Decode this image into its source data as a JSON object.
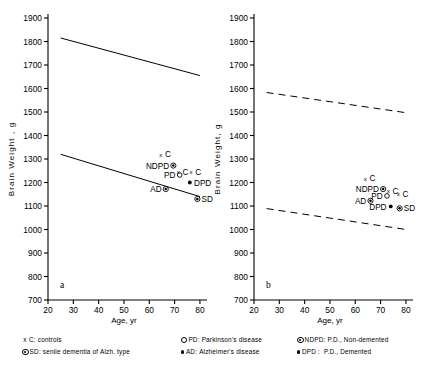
{
  "figure": {
    "panels": [
      {
        "id": "a",
        "label": "a",
        "xlabel": "Age, yr",
        "ylabel": "Brain  Weight , g",
        "xticks": [
          20,
          30,
          40,
          50,
          60,
          70,
          80
        ],
        "yticks": [
          700,
          800,
          900,
          1000,
          1100,
          1200,
          1300,
          1400,
          1500,
          1600,
          1700,
          1800,
          1900
        ],
        "xlim": [
          20,
          82
        ],
        "ylim": [
          700,
          1900
        ],
        "linestyle": "solid",
        "lines": [
          {
            "name": "upper-regression-line",
            "x": [
              25,
              80
            ],
            "y": [
              1815,
              1655
            ]
          },
          {
            "name": "lower-regression-line",
            "x": [
              25,
              80
            ],
            "y": [
              1320,
              1140
            ]
          }
        ],
        "points": [
          {
            "label": "C",
            "marker": "x",
            "x": 64.5,
            "y": 1320,
            "label_pos": "right"
          },
          {
            "label": "NDPD",
            "marker": "circled-dot",
            "x": 69.5,
            "y": 1272,
            "label_pos": "left"
          },
          {
            "label": "C",
            "marker": "x",
            "x": 71.5,
            "y": 1246,
            "label_pos": "right"
          },
          {
            "label": "PD",
            "marker": "open-circle",
            "x": 72.0,
            "y": 1232,
            "label_pos": "left"
          },
          {
            "label": "C",
            "marker": "x",
            "x": 76.5,
            "y": 1246,
            "label_pos": "right"
          },
          {
            "label": "DPD",
            "marker": "dot",
            "x": 76.0,
            "y": 1200,
            "label_pos": "right"
          },
          {
            "label": "AD",
            "marker": "circled-dot",
            "x": 66.5,
            "y": 1172,
            "label_pos": "left"
          },
          {
            "label": "SD",
            "marker": "circled-dot",
            "x": 79.0,
            "y": 1130,
            "label_pos": "right"
          }
        ]
      },
      {
        "id": "b",
        "label": "b",
        "xlabel": "Age, yr",
        "ylabel": "Brain  Weight, g",
        "xticks": [
          20,
          30,
          40,
          50,
          60,
          70,
          80
        ],
        "yticks": [
          700,
          800,
          900,
          1000,
          1100,
          1200,
          1300,
          1400,
          1500,
          1600,
          1700,
          1800,
          1900
        ],
        "xlim": [
          20,
          82
        ],
        "ylim": [
          700,
          1900
        ],
        "linestyle": "dashed",
        "lines": [
          {
            "name": "upper-regression-line",
            "x": [
              25,
              80
            ],
            "y": [
              1583,
              1497
            ]
          },
          {
            "name": "lower-regression-line",
            "x": [
              25,
              80
            ],
            "y": [
              1089,
              1000
            ]
          }
        ],
        "points": [
          {
            "label": "C",
            "marker": "x",
            "x": 64.0,
            "y": 1218,
            "label_pos": "right"
          },
          {
            "label": "NDPD",
            "marker": "circled-dot",
            "x": 71.0,
            "y": 1172,
            "label_pos": "left"
          },
          {
            "label": "C",
            "marker": "x",
            "x": 73.0,
            "y": 1166,
            "label_pos": "right"
          },
          {
            "label": "PD",
            "marker": "open-circle",
            "x": 72.5,
            "y": 1143,
            "label_pos": "left"
          },
          {
            "label": "C",
            "marker": "x",
            "x": 77.0,
            "y": 1152,
            "label_pos": "right"
          },
          {
            "label": "AD",
            "marker": "circled-dot",
            "x": 66.0,
            "y": 1122,
            "label_pos": "left"
          },
          {
            "label": "DPD",
            "marker": "dot",
            "x": 74.0,
            "y": 1098,
            "label_pos": "left"
          },
          {
            "label": "SD",
            "marker": "circled-dot",
            "x": 77.5,
            "y": 1090,
            "label_pos": "right"
          }
        ]
      }
    ],
    "legend": {
      "columns": [
        {
          "entries": [
            {
              "marker": "x",
              "code": "C",
              "sep": ":",
              "text": "controls"
            },
            {
              "marker": "circled-dot",
              "code": "SD",
              "sep": ":",
              "text": "senile dementia of  Alzh. type"
            }
          ]
        },
        {
          "entries": [
            {
              "marker": "open-circle",
              "code": "PD",
              "sep": ":",
              "text": "Parkinson's disease"
            },
            {
              "marker": "dot",
              "code": "AD",
              "sep": ":",
              "text": "Alzheimer's disease"
            }
          ]
        },
        {
          "entries": [
            {
              "marker": "circled-dot",
              "code": "NDPD",
              "sep": ":",
              "text": "P.D., Non-demented"
            },
            {
              "marker": "dot",
              "code": "DPD",
              "sep": " : ",
              "text": "P.D., Demented"
            }
          ]
        }
      ]
    }
  },
  "chart_data": {
    "type": "scatter",
    "title": "",
    "xlabel": "Age, yr",
    "ylabel": "Brain Weight, g",
    "xlim": [
      20,
      82
    ],
    "ylim": [
      700,
      1900
    ],
    "grid": false,
    "legend_position": "below",
    "subplots": [
      {
        "panel": "a",
        "line_style": "solid",
        "regression_bands": [
          {
            "name": "upper",
            "x": [
              25,
              80
            ],
            "y": [
              1815,
              1655
            ]
          },
          {
            "name": "lower",
            "x": [
              25,
              80
            ],
            "y": [
              1320,
              1140
            ]
          }
        ],
        "x": [
          64.5,
          69.5,
          71.5,
          72.0,
          76.5,
          76.0,
          66.5,
          79.0
        ],
        "y": [
          1320,
          1272,
          1246,
          1232,
          1246,
          1200,
          1172,
          1130
        ],
        "labels": [
          "C",
          "NDPD",
          "C",
          "PD",
          "C",
          "DPD",
          "AD",
          "SD"
        ],
        "markers": [
          "x",
          "circled-dot",
          "x",
          "open-circle",
          "x",
          "dot",
          "circled-dot",
          "circled-dot"
        ]
      },
      {
        "panel": "b",
        "line_style": "dashed",
        "regression_bands": [
          {
            "name": "upper",
            "x": [
              25,
              80
            ],
            "y": [
              1583,
              1497
            ]
          },
          {
            "name": "lower",
            "x": [
              25,
              80
            ],
            "y": [
              1089,
              1000
            ]
          }
        ],
        "x": [
          64.0,
          71.0,
          73.0,
          72.5,
          77.0,
          66.0,
          74.0,
          77.5
        ],
        "y": [
          1218,
          1172,
          1166,
          1143,
          1152,
          1122,
          1098,
          1090
        ],
        "labels": [
          "C",
          "NDPD",
          "C",
          "PD",
          "C",
          "AD",
          "DPD",
          "SD"
        ],
        "markers": [
          "x",
          "circled-dot",
          "x",
          "open-circle",
          "x",
          "circled-dot",
          "dot",
          "circled-dot"
        ]
      }
    ],
    "legend_entries": [
      {
        "code": "C",
        "marker": "x",
        "description": "controls"
      },
      {
        "code": "SD",
        "marker": "circled-dot",
        "description": "senile dementia of Alzh. type"
      },
      {
        "code": "PD",
        "marker": "open-circle",
        "description": "Parkinson's disease"
      },
      {
        "code": "AD",
        "marker": "dot",
        "description": "Alzheimer's disease"
      },
      {
        "code": "NDPD",
        "marker": "circled-dot",
        "description": "P.D., Non-demented"
      },
      {
        "code": "DPD",
        "marker": "dot",
        "description": "P.D., Demented"
      }
    ]
  }
}
